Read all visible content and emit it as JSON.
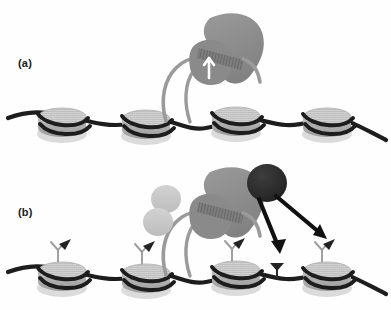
{
  "figure": {
    "width": 391,
    "height": 310,
    "background": "#fefefe",
    "type": "scientific-schematic"
  },
  "panels": [
    {
      "id": "a",
      "label": "(a)",
      "label_x": 18,
      "label_y": 57,
      "description": "Polymerase engaged on chromatin fiber with extruded DNA loop; no histone tail marks present."
    },
    {
      "id": "b",
      "label": "(b)",
      "label_x": 18,
      "label_y": 206,
      "description": "Same polymerase complex with accessory factor and dark effector depositing modification marks onto histone tails via arrows."
    }
  ],
  "colors": {
    "fiber_dna": "#1d1d1d",
    "nucleosome_top": "#c9c9c9",
    "nucleosome_side": "#a9a9a9",
    "nucleosome_shadow": "#bdbdbd",
    "polymerase_body": "#8d8d8d",
    "polymerase_lobe": "#8a8a8a",
    "polymerase_channel": "#6e6e6e",
    "nascent_dna": "#9a9a9a",
    "factor_blob": "#c4c4c4",
    "effector_blob": "#2a2a2a",
    "arrow": "#111111",
    "mark_flag": "#232323",
    "mark_stalk": "#9c9c9c",
    "arrow_white": "#ffffff",
    "label_text": "#202020"
  },
  "panel_a": {
    "nucleosomes": [
      {
        "name": "nucleosome-a1",
        "cx": 62,
        "cy": 118
      },
      {
        "name": "nucleosome-a2",
        "cx": 146,
        "cy": 120
      },
      {
        "name": "nucleosome-a3",
        "cx": 236,
        "cy": 117
      },
      {
        "name": "nucleosome-a4",
        "cx": 327,
        "cy": 118
      }
    ],
    "polymerase": {
      "name": "rna-polymerase-a",
      "cx": 217,
      "cy": 50,
      "channel_label": "dna-channel",
      "arrow_label": "transcription-direction-arrow",
      "arrow_color": "#ffffff"
    },
    "dna_loop": {
      "name": "extruded-dna-loop-a",
      "from": "polymerase",
      "to": "fiber"
    }
  },
  "panel_b": {
    "nucleosomes": [
      {
        "name": "nucleosome-b1",
        "cx": 62,
        "cy": 272,
        "has_mark": true
      },
      {
        "name": "nucleosome-b2",
        "cx": 146,
        "cy": 274,
        "has_mark": true
      },
      {
        "name": "nucleosome-b3",
        "cx": 236,
        "cy": 271,
        "has_mark": true
      },
      {
        "name": "nucleosome-b4",
        "cx": 327,
        "cy": 272,
        "has_mark": true
      }
    ],
    "free_mark": {
      "name": "free-modification-mark",
      "x": 277,
      "y": 262
    },
    "polymerase": {
      "name": "rna-polymerase-b",
      "cx": 217,
      "cy": 205
    },
    "factor_complex": {
      "name": "accessory-factor-complex",
      "cx": 163,
      "cy": 212,
      "lobes": 2
    },
    "effector": {
      "name": "effector-enzyme-blob",
      "cx": 267,
      "cy": 183
    },
    "arrows": [
      {
        "name": "deposition-arrow-left",
        "x1": 262,
        "x2": 283,
        "y1": 198,
        "y2": 250
      },
      {
        "name": "deposition-arrow-right",
        "x1": 276,
        "x2": 327,
        "y1": 196,
        "y2": 238
      }
    ]
  }
}
